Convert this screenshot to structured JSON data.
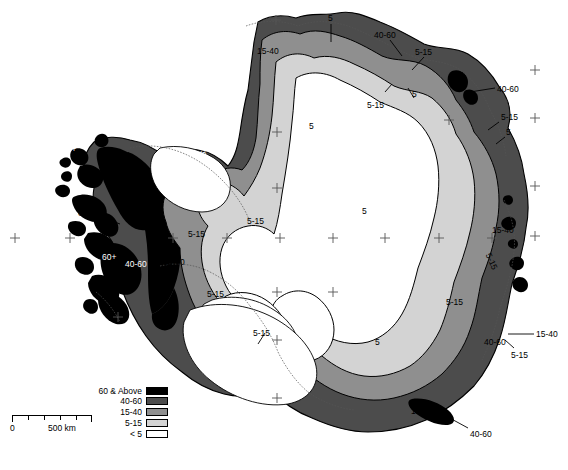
{
  "figure": {
    "name": "antarctica-accumulation-map"
  },
  "legend": {
    "title": "",
    "items": [
      {
        "label": "60 & Above",
        "swatch": "sw-60",
        "color": "#000000"
      },
      {
        "label": "40-60",
        "swatch": "sw-4060",
        "color": "#4c4c4c"
      },
      {
        "label": "15-40",
        "swatch": "sw-1540",
        "color": "#8f8f8f"
      },
      {
        "label": "5-15",
        "swatch": "sw-515",
        "color": "#d3d3d3"
      },
      {
        "label": "< 5",
        "swatch": "sw-lt5",
        "color": "#ffffff"
      }
    ]
  },
  "scalebar": {
    "min_label": "0",
    "max_label": "500 km",
    "ticks": 6
  },
  "map_labels": [
    {
      "id": "lbl-top-5",
      "text": "5",
      "x": 328,
      "y": 14,
      "color": "black",
      "rotate": 0
    },
    {
      "id": "lbl-top-4060",
      "text": "40-60",
      "x": 374,
      "y": 31,
      "color": "black",
      "rotate": 0
    },
    {
      "id": "lbl-top-1540",
      "text": "15-40",
      "x": 257,
      "y": 47,
      "color": "black",
      "rotate": 0
    },
    {
      "id": "lbl-ne-515a",
      "text": "5-15",
      "x": 415,
      "y": 48,
      "color": "black",
      "rotate": 0
    },
    {
      "id": "lbl-ne-4060",
      "text": "40-60",
      "x": 497,
      "y": 85,
      "color": "black",
      "rotate": 0
    },
    {
      "id": "lbl-ne-5a",
      "text": "5",
      "x": 412,
      "y": 90,
      "color": "black",
      "rotate": 0
    },
    {
      "id": "lbl-ne-515b",
      "text": "5-15",
      "x": 367,
      "y": 101,
      "color": "black",
      "rotate": 0
    },
    {
      "id": "lbl-e-515c",
      "text": "5-15",
      "x": 501,
      "y": 113,
      "color": "black",
      "rotate": 0
    },
    {
      "id": "lbl-e-5b",
      "text": "5",
      "x": 506,
      "y": 128,
      "color": "black",
      "rotate": 0
    },
    {
      "id": "lbl-int-5a",
      "text": "5",
      "x": 309,
      "y": 122,
      "color": "black",
      "rotate": 0
    },
    {
      "id": "lbl-int-5b",
      "text": "5",
      "x": 362,
      "y": 207,
      "color": "black",
      "rotate": 0
    },
    {
      "id": "lbl-int-5c",
      "text": "5",
      "x": 375,
      "y": 338,
      "color": "black",
      "rotate": 0
    },
    {
      "id": "lbl-peninsula-60a",
      "text": "60+",
      "x": 62,
      "y": 145,
      "color": "white",
      "rotate": 0
    },
    {
      "id": "lbl-peninsula-60b",
      "text": "60+",
      "x": 78,
      "y": 209,
      "color": "black",
      "rotate": 0
    },
    {
      "id": "lbl-peninsula-60c",
      "text": "60+",
      "x": 102,
      "y": 253,
      "color": "white",
      "rotate": 0
    },
    {
      "id": "lbl-w-4060",
      "text": "40-60",
      "x": 125,
      "y": 260,
      "color": "white",
      "rotate": 0
    },
    {
      "id": "lbl-w-1540",
      "text": "15-40",
      "x": 163,
      "y": 258,
      "color": "black",
      "rotate": 0
    },
    {
      "id": "lbl-wrot-1540",
      "text": "15-40",
      "x": 196,
      "y": 158,
      "color": "white",
      "rotate": -62
    },
    {
      "id": "lbl-w-515a",
      "text": "5-15",
      "x": 188,
      "y": 230,
      "color": "black",
      "rotate": 0
    },
    {
      "id": "lbl-c-515b",
      "text": "5-15",
      "x": 247,
      "y": 217,
      "color": "black",
      "rotate": 0
    },
    {
      "id": "lbl-s-515c",
      "text": "5-15",
      "x": 207,
      "y": 290,
      "color": "black",
      "rotate": 0
    },
    {
      "id": "lbl-s-515d",
      "text": "5-15",
      "x": 253,
      "y": 329,
      "color": "black",
      "rotate": 0
    },
    {
      "id": "lbl-e-1540",
      "text": "15-40",
      "x": 492,
      "y": 226,
      "color": "black",
      "rotate": 0
    },
    {
      "id": "lbl-erot-515",
      "text": "5-15",
      "x": 492,
      "y": 252,
      "color": "black",
      "rotate": 66
    },
    {
      "id": "lbl-se-515",
      "text": "5-15",
      "x": 446,
      "y": 298,
      "color": "black",
      "rotate": 0
    },
    {
      "id": "lbl-se-1540b",
      "text": "15-40",
      "x": 536,
      "y": 330,
      "color": "black",
      "rotate": 0
    },
    {
      "id": "lbl-se-4060",
      "text": "40-60",
      "x": 484,
      "y": 338,
      "color": "black",
      "rotate": 0
    },
    {
      "id": "lbl-se-515b",
      "text": "5-15",
      "x": 511,
      "y": 351,
      "color": "black",
      "rotate": 0
    },
    {
      "id": "lbl-s-1540",
      "text": "15-40",
      "x": 411,
      "y": 407,
      "color": "black",
      "rotate": 0
    },
    {
      "id": "lbl-s-4060",
      "text": "40-60",
      "x": 470,
      "y": 430,
      "color": "black",
      "rotate": 0
    }
  ],
  "colors": {
    "zone_60_plus": "#000000",
    "zone_40_60": "#4c4c4c",
    "zone_15_40": "#8f8f8f",
    "zone_5_15": "#d3d3d3",
    "zone_lt_5": "#ffffff",
    "outline": "#000000",
    "background": "#ffffff"
  }
}
